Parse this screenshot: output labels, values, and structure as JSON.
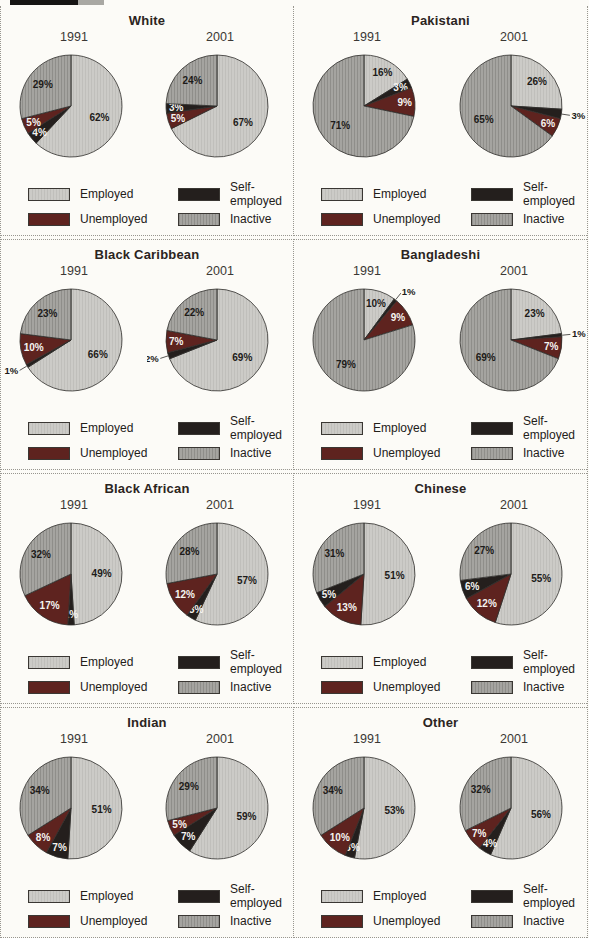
{
  "colors": {
    "employed": "#cccbc7",
    "employed_stripe": "#c0bfbb",
    "self_employed": "#241f1d",
    "unemployed": "#5e231f",
    "inactive": "#a5a4a0",
    "inactive_stripe": "#8f8e8a",
    "outline": "#2f2d2b",
    "label_dark": "#1d1b19",
    "label_light": "#f5f4f1",
    "dotted_rule": "#98968f"
  },
  "legend": {
    "items": [
      {
        "key": "employed",
        "label": "Employed"
      },
      {
        "key": "self_employed",
        "label": "Self-employed"
      },
      {
        "key": "unemployed",
        "label": "Unemployed"
      },
      {
        "key": "inactive",
        "label": "Inactive"
      }
    ]
  },
  "chart_data": {
    "type": "pie",
    "unit": "%",
    "layout": {
      "rows": 4,
      "cols": 2,
      "pies_per_panel": 2,
      "legend_position": "below-each-panel",
      "slice_start": "12-o'clock",
      "direction": "clockwise"
    },
    "panels": [
      {
        "title": "White",
        "pies": [
          {
            "year": "1991",
            "slices": [
              {
                "category": "Employed",
                "value": 62,
                "label": "62%",
                "color": "employed",
                "label_pos": "inside"
              },
              {
                "category": "Self-employed",
                "value": 4,
                "label": "4%",
                "color": "self_employed",
                "label_pos": "inside"
              },
              {
                "category": "Unemployed",
                "value": 5,
                "label": "5%",
                "color": "unemployed",
                "label_pos": "inside"
              },
              {
                "category": "Inactive",
                "value": 29,
                "label": "29%",
                "color": "inactive",
                "label_pos": "inside"
              }
            ]
          },
          {
            "year": "2001",
            "slices": [
              {
                "category": "Employed",
                "value": 67,
                "label": "67%",
                "color": "employed",
                "label_pos": "inside"
              },
              {
                "category": "Unemployed",
                "value": 5,
                "label": "5%",
                "color": "unemployed",
                "label_pos": "inside"
              },
              {
                "category": "Self-employed",
                "value": 3,
                "label": "3%",
                "color": "self_employed",
                "label_pos": "inside"
              },
              {
                "category": "Inactive",
                "value": 24,
                "label": "24%",
                "color": "inactive",
                "label_pos": "inside"
              }
            ]
          }
        ]
      },
      {
        "title": "Pakistani",
        "pies": [
          {
            "year": "1991",
            "slices": [
              {
                "category": "Employed",
                "value": 16,
                "label": "16%",
                "color": "employed",
                "label_pos": "inside"
              },
              {
                "category": "Self-employed",
                "value": 3,
                "label": "3%",
                "color": "self_employed",
                "label_pos": "inside"
              },
              {
                "category": "Unemployed",
                "value": 9,
                "label": "9%",
                "color": "unemployed",
                "label_pos": "inside"
              },
              {
                "category": "Inactive",
                "value": 71,
                "label": "71%",
                "color": "inactive",
                "label_pos": "inside"
              }
            ]
          },
          {
            "year": "2001",
            "slices": [
              {
                "category": "Employed",
                "value": 26,
                "label": "26%",
                "color": "employed",
                "label_pos": "inside"
              },
              {
                "category": "Self-employed",
                "value": 3,
                "label": "3%",
                "color": "self_employed",
                "label_pos": "outside"
              },
              {
                "category": "Unemployed",
                "value": 6,
                "label": "6%",
                "color": "unemployed",
                "label_pos": "inside"
              },
              {
                "category": "Inactive",
                "value": 65,
                "label": "65%",
                "color": "inactive",
                "label_pos": "inside"
              }
            ]
          }
        ]
      },
      {
        "title": "Black Caribbean",
        "pies": [
          {
            "year": "1991",
            "slices": [
              {
                "category": "Employed",
                "value": 66,
                "label": "66%",
                "color": "employed",
                "label_pos": "inside"
              },
              {
                "category": "Self-employed",
                "value": 1,
                "label": "1%",
                "color": "self_employed",
                "label_pos": "outside"
              },
              {
                "category": "Unemployed",
                "value": 10,
                "label": "10%",
                "color": "unemployed",
                "label_pos": "inside"
              },
              {
                "category": "Inactive",
                "value": 23,
                "label": "23%",
                "color": "inactive",
                "label_pos": "inside"
              }
            ]
          },
          {
            "year": "2001",
            "slices": [
              {
                "category": "Employed",
                "value": 69,
                "label": "69%",
                "color": "employed",
                "label_pos": "inside"
              },
              {
                "category": "Self-employed",
                "value": 2,
                "label": "2%",
                "color": "self_employed",
                "label_pos": "outside"
              },
              {
                "category": "Unemployed",
                "value": 7,
                "label": "7%",
                "color": "unemployed",
                "label_pos": "inside"
              },
              {
                "category": "Inactive",
                "value": 22,
                "label": "22%",
                "color": "inactive",
                "label_pos": "inside"
              }
            ]
          }
        ]
      },
      {
        "title": "Bangladeshi",
        "pies": [
          {
            "year": "1991",
            "slices": [
              {
                "category": "Employed",
                "value": 10,
                "label": "10%",
                "color": "employed",
                "label_pos": "inside"
              },
              {
                "category": "Self-employed",
                "value": 1,
                "label": "1%",
                "color": "self_employed",
                "label_pos": "outside"
              },
              {
                "category": "Unemployed",
                "value": 9,
                "label": "9%",
                "color": "unemployed",
                "label_pos": "inside"
              },
              {
                "category": "Inactive",
                "value": 79,
                "label": "79%",
                "color": "inactive",
                "label_pos": "inside"
              }
            ]
          },
          {
            "year": "2001",
            "slices": [
              {
                "category": "Employed",
                "value": 23,
                "label": "23%",
                "color": "employed",
                "label_pos": "inside"
              },
              {
                "category": "Self-employed",
                "value": 1,
                "label": "1%",
                "color": "self_employed",
                "label_pos": "outside"
              },
              {
                "category": "Unemployed",
                "value": 7,
                "label": "7%",
                "color": "unemployed",
                "label_pos": "inside"
              },
              {
                "category": "Inactive",
                "value": 69,
                "label": "69%",
                "color": "inactive",
                "label_pos": "inside"
              }
            ]
          }
        ]
      },
      {
        "title": "Black African",
        "pies": [
          {
            "year": "1991",
            "slices": [
              {
                "category": "Employed",
                "value": 49,
                "label": "49%",
                "color": "employed",
                "label_pos": "inside"
              },
              {
                "category": "Self-employed",
                "value": 2,
                "label": "2%",
                "color": "self_employed",
                "label_pos": "inside"
              },
              {
                "category": "Unemployed",
                "value": 17,
                "label": "17%",
                "color": "unemployed",
                "label_pos": "inside"
              },
              {
                "category": "Inactive",
                "value": 32,
                "label": "32%",
                "color": "inactive",
                "label_pos": "inside"
              }
            ]
          },
          {
            "year": "2001",
            "slices": [
              {
                "category": "Employed",
                "value": 57,
                "label": "57%",
                "color": "employed",
                "label_pos": "inside"
              },
              {
                "category": "Self-employed",
                "value": 3,
                "label": "3%",
                "color": "self_employed",
                "label_pos": "inside"
              },
              {
                "category": "Unemployed",
                "value": 12,
                "label": "12%",
                "color": "unemployed",
                "label_pos": "inside"
              },
              {
                "category": "Inactive",
                "value": 28,
                "label": "28%",
                "color": "inactive",
                "label_pos": "inside"
              }
            ]
          }
        ]
      },
      {
        "title": "Chinese",
        "pies": [
          {
            "year": "1991",
            "slices": [
              {
                "category": "Employed",
                "value": 51,
                "label": "51%",
                "color": "employed",
                "label_pos": "inside"
              },
              {
                "category": "Unemployed",
                "value": 13,
                "label": "13%",
                "color": "unemployed",
                "label_pos": "inside"
              },
              {
                "category": "Self-employed",
                "value": 5,
                "label": "5%",
                "color": "self_employed",
                "label_pos": "inside"
              },
              {
                "category": "Inactive",
                "value": 31,
                "label": "31%",
                "color": "inactive",
                "label_pos": "inside"
              }
            ]
          },
          {
            "year": "2001",
            "slices": [
              {
                "category": "Employed",
                "value": 55,
                "label": "55%",
                "color": "employed",
                "label_pos": "inside"
              },
              {
                "category": "Unemployed",
                "value": 12,
                "label": "12%",
                "color": "unemployed",
                "label_pos": "inside"
              },
              {
                "category": "Self-employed",
                "value": 6,
                "label": "6%",
                "color": "self_employed",
                "label_pos": "inside"
              },
              {
                "category": "Inactive",
                "value": 27,
                "label": "27%",
                "color": "inactive",
                "label_pos": "inside"
              }
            ]
          }
        ]
      },
      {
        "title": "Indian",
        "pies": [
          {
            "year": "1991",
            "slices": [
              {
                "category": "Employed",
                "value": 51,
                "label": "51%",
                "color": "employed",
                "label_pos": "inside"
              },
              {
                "category": "Self-employed",
                "value": 7,
                "label": "7%",
                "color": "self_employed",
                "label_pos": "inside"
              },
              {
                "category": "Unemployed",
                "value": 8,
                "label": "8%",
                "color": "unemployed",
                "label_pos": "inside"
              },
              {
                "category": "Inactive",
                "value": 34,
                "label": "34%",
                "color": "inactive",
                "label_pos": "inside"
              }
            ]
          },
          {
            "year": "2001",
            "slices": [
              {
                "category": "Employed",
                "value": 59,
                "label": "59%",
                "color": "employed",
                "label_pos": "inside"
              },
              {
                "category": "Self-employed",
                "value": 7,
                "label": "7%",
                "color": "self_employed",
                "label_pos": "inside"
              },
              {
                "category": "Unemployed",
                "value": 5,
                "label": "5%",
                "color": "unemployed",
                "label_pos": "inside"
              },
              {
                "category": "Inactive",
                "value": 29,
                "label": "29%",
                "color": "inactive",
                "label_pos": "inside"
              }
            ]
          }
        ]
      },
      {
        "title": "Other",
        "pies": [
          {
            "year": "1991",
            "slices": [
              {
                "category": "Employed",
                "value": 53,
                "label": "53%",
                "color": "employed",
                "label_pos": "inside"
              },
              {
                "category": "Self-employed",
                "value": 3,
                "label": "3%",
                "color": "self_employed",
                "label_pos": "inside"
              },
              {
                "category": "Unemployed",
                "value": 10,
                "label": "10%",
                "color": "unemployed",
                "label_pos": "inside"
              },
              {
                "category": "Inactive",
                "value": 34,
                "label": "34%",
                "color": "inactive",
                "label_pos": "inside"
              }
            ]
          },
          {
            "year": "2001",
            "slices": [
              {
                "category": "Employed",
                "value": 56,
                "label": "56%",
                "color": "employed",
                "label_pos": "inside"
              },
              {
                "category": "Self-employed",
                "value": 4,
                "label": "4%",
                "color": "self_employed",
                "label_pos": "inside"
              },
              {
                "category": "Unemployed",
                "value": 7,
                "label": "7%",
                "color": "unemployed",
                "label_pos": "inside"
              },
              {
                "category": "Inactive",
                "value": 32,
                "label": "32%",
                "color": "inactive",
                "label_pos": "inside"
              }
            ]
          }
        ]
      }
    ]
  }
}
